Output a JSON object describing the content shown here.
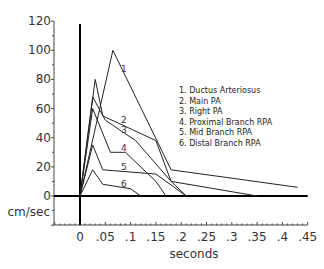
{
  "chart_data": {
    "type": "line",
    "title": "",
    "xlabel": "seconds",
    "ylabel": "cm/sec",
    "xlim": [
      -0.05,
      0.45
    ],
    "ylim": [
      -20,
      120
    ],
    "x_ticks": [
      "0",
      ".05",
      ".1",
      ".15",
      ".2",
      ".25",
      ".3",
      ".35",
      ".4",
      ".45"
    ],
    "y_ticks": [
      "0",
      "20",
      "40",
      "60",
      "80",
      "100",
      "120"
    ],
    "grid": false,
    "legend_position": "upper right",
    "legend": [
      "1. Ductus Arteriosus",
      "2. Main PA",
      "3. Right PA",
      "4. Proximal Branch RPA",
      "5. Mid Branch RPA",
      "6. Distal Branch RPA"
    ],
    "series": [
      {
        "name": "Ductus Arteriosus",
        "label": "1",
        "points": [
          [
            0,
            0
          ],
          [
            0.065,
            100
          ],
          [
            0.18,
            18
          ],
          [
            0.43,
            6
          ]
        ]
      },
      {
        "name": "Main PA",
        "label": "2",
        "points": [
          [
            0,
            0
          ],
          [
            0.03,
            80
          ],
          [
            0.045,
            55
          ],
          [
            0.15,
            38
          ],
          [
            0.18,
            10
          ],
          [
            0.35,
            0
          ]
        ]
      },
      {
        "name": "Right PA",
        "label": "3",
        "points": [
          [
            0,
            0
          ],
          [
            0.025,
            68
          ],
          [
            0.05,
            52
          ],
          [
            0.11,
            38
          ],
          [
            0.18,
            10
          ],
          [
            0.21,
            0
          ]
        ]
      },
      {
        "name": "Proximal Branch RPA",
        "label": "4",
        "points": [
          [
            0,
            0
          ],
          [
            0.025,
            60
          ],
          [
            0.06,
            30
          ],
          [
            0.09,
            30
          ],
          [
            0.15,
            10
          ],
          [
            0.17,
            0
          ]
        ]
      },
      {
        "name": "Mid Branch RPA",
        "label": "5",
        "points": [
          [
            0,
            0
          ],
          [
            0.025,
            35
          ],
          [
            0.045,
            18
          ],
          [
            0.15,
            15
          ],
          [
            0.21,
            0
          ]
        ]
      },
      {
        "name": "Distal Branch RPA",
        "label": "6",
        "points": [
          [
            0,
            0
          ],
          [
            0.025,
            18
          ],
          [
            0.045,
            8
          ],
          [
            0.1,
            5
          ],
          [
            0.12,
            0
          ]
        ]
      }
    ],
    "curve_label_positions": [
      {
        "label": "1",
        "x": 0.075,
        "y": 85
      },
      {
        "label": "2",
        "x": 0.075,
        "y": 50
      },
      {
        "label": "3",
        "x": 0.075,
        "y": 43
      },
      {
        "label": "4",
        "x": 0.075,
        "y": 31
      },
      {
        "label": "5",
        "x": 0.075,
        "y": 18
      },
      {
        "label": "6",
        "x": 0.075,
        "y": 6
      }
    ]
  }
}
